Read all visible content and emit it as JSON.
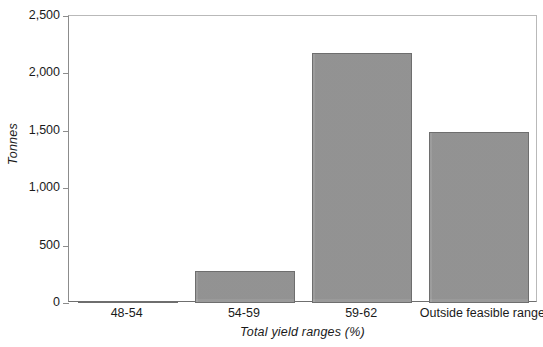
{
  "chart_data": {
    "type": "bar",
    "title": "",
    "xlabel": "Total yield ranges (%)",
    "ylabel": "Tonnes",
    "categories": [
      "48-54",
      "54-59",
      "59-62",
      "Outside feasible range"
    ],
    "values": [
      20,
      280,
      2180,
      1490
    ],
    "ylim": [
      0,
      2500
    ],
    "yticks": [
      0,
      500,
      1000,
      1500,
      2000,
      2500
    ],
    "ytick_labels": [
      "0",
      "500",
      "1,000",
      "1,500",
      "2,000",
      "2,500"
    ],
    "grid": false,
    "legend": null,
    "series": [
      {
        "name": "Tonnes",
        "values": [
          20,
          280,
          2180,
          1490
        ],
        "color": "#9b9b9b",
        "edge_color": "#6e6e6e"
      }
    ],
    "colors": {
      "bar_fill": "#9b9b9b",
      "bar_edge": "#6e6e6e",
      "axis": "#8c8c8c",
      "frame": "#b9b9b9",
      "text": "#1a1a1a",
      "background": "#ffffff"
    }
  }
}
